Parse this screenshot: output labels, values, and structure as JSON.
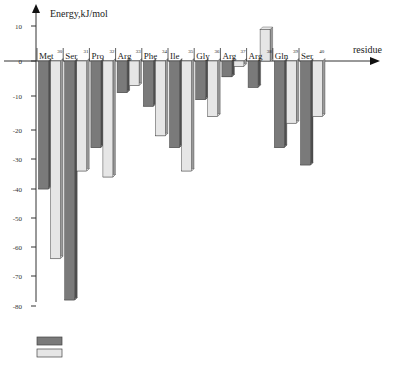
{
  "chart_data": {
    "type": "bar",
    "title": "",
    "ylabel": "Energy,kJ/mol",
    "xlabel": "residue",
    "ylim": [
      -80,
      10
    ],
    "yticks": [
      10,
      0,
      -10,
      -20,
      -30,
      -40,
      -50,
      -60,
      -70,
      -80
    ],
    "grid": false,
    "legend_placement": "bottom-left",
    "categories": [
      {
        "name": "Met",
        "num": "30"
      },
      {
        "name": "Ser",
        "num": "31"
      },
      {
        "name": "Pro",
        "num": "32"
      },
      {
        "name": "Arg",
        "num": "33"
      },
      {
        "name": "Phe",
        "num": "34"
      },
      {
        "name": "Ile",
        "num": "35"
      },
      {
        "name": "Gly",
        "num": "36"
      },
      {
        "name": "Arg",
        "num": "37"
      },
      {
        "name": "Arg",
        "num": "38"
      },
      {
        "name": "Gln",
        "num": "39"
      },
      {
        "name": "Ser",
        "num": "40"
      }
    ],
    "series": [
      {
        "name": "",
        "color": "#7a7a7a",
        "side_color": "#4e4e4e",
        "values": [
          -40,
          -78,
          -26,
          -9,
          -13,
          -26,
          -11,
          -4.5,
          -7.5,
          -26,
          -32
        ]
      },
      {
        "name": "",
        "color": "#e6e6e6",
        "side_color": "#9a9a9a",
        "values": [
          -64,
          -34,
          -36,
          -7,
          -22,
          -34,
          -16,
          -1.5,
          9,
          -18,
          -16
        ]
      }
    ]
  }
}
